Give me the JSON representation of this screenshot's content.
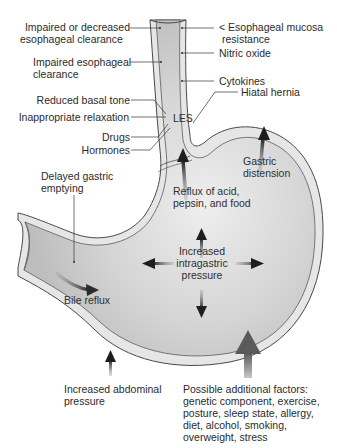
{
  "figure": {
    "colors": {
      "stomach_fill": "#c9c9c9",
      "stomach_fill_light": "#ececec",
      "wall": "#e6e6e6",
      "outline": "#4a4a4a",
      "arrow": "#2a2a2a",
      "large_arrow": "#6e6e6e",
      "text": "#2b2b2b"
    }
  },
  "labels": {
    "left": {
      "impaired_decreased": [
        "Impaired or decreased",
        "esophageal clearance"
      ],
      "impaired_clearance": [
        "Impaired esophageal",
        "clearance"
      ],
      "reduced_basal_tone": "Reduced basal tone",
      "inappropriate_relaxation": "Inappropriate relaxation",
      "drugs": "Drugs",
      "hormones": "Hormones",
      "delayed_emptying": [
        "Delayed gastric",
        "emptying"
      ]
    },
    "right": {
      "mucosa_resistance": [
        "< Esophageal mucosa",
        "resistance"
      ],
      "nitric_oxide": "Nitric oxide",
      "cytokines": "Cytokines",
      "hiatal_hernia": "Hiatal hernia"
    },
    "inside": {
      "les": "LES",
      "reflux": [
        "Reflux of acid,",
        "pepsin, and food"
      ],
      "gastric_distension": [
        "Gastric",
        "distension"
      ],
      "intragastric_pressure": [
        "Increased",
        "intragastric",
        "pressure"
      ],
      "bile_reflux": "Bile reflux"
    },
    "bottom": {
      "abdominal_pressure": [
        "Increased abdominal",
        "pressure"
      ],
      "additional_factors": [
        "Possible additional factors:",
        "genetic component, exercise,",
        "posture, sleep state, allergy,",
        "diet, alcohol, smoking,",
        "overweight, stress"
      ]
    }
  },
  "icons": {
    "arrow_up": "arrow-up",
    "arrow_down": "arrow-down",
    "arrow_left": "arrow-left",
    "arrow_right": "arrow-right",
    "curved_arrow": "curved-arrow"
  }
}
